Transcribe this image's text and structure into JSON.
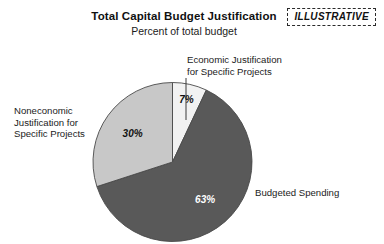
{
  "header": {
    "title": "Total Capital Budget Justification",
    "subtitle": "Percent of total budget",
    "badge": "ILLUSTRATIVE"
  },
  "labels": {
    "economic": "Economic Justification\nfor Specific Projects",
    "noneconomic": "Noneconomic\nJustification for\nSpecific Projects",
    "budgeted": "Budgeted Spending"
  },
  "chart_data": {
    "type": "pie",
    "title": "Total Capital Budget Justification",
    "subtitle": "Percent of total budget",
    "unit": "percent of total budget",
    "categories": [
      "Economic Justification for Specific Projects",
      "Budgeted Spending",
      "Noneconomic Justification for Specific Projects"
    ],
    "values": [
      7,
      63,
      30
    ],
    "data_labels": [
      "7%",
      "63%",
      "30%"
    ],
    "colors": [
      "#F2F2F2",
      "#595959",
      "#C8C8C8"
    ],
    "label_colors": [
      "#111111",
      "#FFFFFF",
      "#111111"
    ],
    "start_angle_deg": 0,
    "direction": "clockwise",
    "legend": "none",
    "grid": false
  }
}
